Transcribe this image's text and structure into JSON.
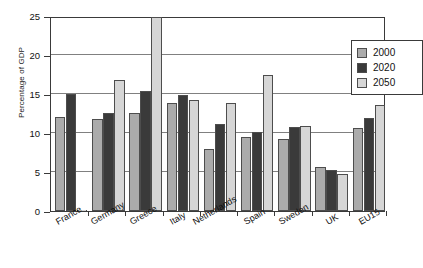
{
  "chart_data": {
    "type": "bar",
    "title": "",
    "xlabel": "",
    "ylabel": "Percentage of GDP",
    "ylim": [
      0,
      25
    ],
    "yticks": [
      0,
      5,
      10,
      15,
      20,
      25
    ],
    "ytick_labels": [
      "0",
      "5",
      "10",
      "15",
      "20",
      "25"
    ],
    "grid": true,
    "grid_axis": "y",
    "legend_position": "top-right-inside",
    "categories": [
      "France",
      "Germany",
      "Greece",
      "Italy",
      "Netherlands",
      "Spain",
      "Sweden",
      "UK",
      "EU15"
    ],
    "series": [
      {
        "name": "2000",
        "color": "#ababab",
        "values": [
          12.0,
          11.8,
          12.6,
          13.9,
          8.0,
          9.5,
          9.2,
          5.7,
          10.6
        ]
      },
      {
        "name": "2020",
        "color": "#3a3a3a",
        "values": [
          15.0,
          12.6,
          15.4,
          14.9,
          11.2,
          10.1,
          10.8,
          5.2,
          11.9
        ]
      },
      {
        "name": "2050",
        "color": "#d6d6d6",
        "values": [
          0.0,
          16.8,
          24.9,
          14.2,
          13.8,
          17.4,
          10.9,
          4.7,
          13.6
        ]
      }
    ]
  },
  "legend": {
    "items": [
      {
        "label": "2000",
        "color": "#ababab"
      },
      {
        "label": "2020",
        "color": "#3a3a3a"
      },
      {
        "label": "2050",
        "color": "#d6d6d6"
      }
    ]
  },
  "colors": {
    "axis": "#3a3a3a",
    "grid": "#808080",
    "background": "#ffffff",
    "bar_outline": "#4d4d4d"
  }
}
